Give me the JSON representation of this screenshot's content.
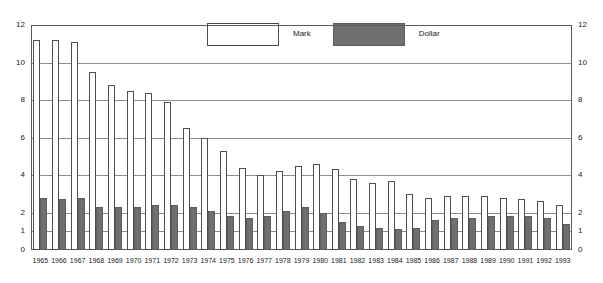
{
  "chart_data": {
    "type": "bar",
    "title": "",
    "subtitle": "",
    "xlabel": "",
    "ylabel": "",
    "ylim": [
      0,
      12
    ],
    "yticks": [
      0,
      1,
      2,
      4,
      6,
      8,
      10,
      12
    ],
    "ytick_labels": [
      "0",
      "1",
      "2",
      "4",
      "6",
      "8",
      "10",
      "12"
    ],
    "grid": true,
    "grid_axis": "y",
    "legend_position": "top-center",
    "dual_y_axis": true,
    "categories": [
      "1965",
      "1966",
      "1967",
      "1968",
      "1969",
      "1970",
      "1971",
      "1972",
      "1973",
      "1974",
      "1975",
      "1976",
      "1977",
      "1978",
      "1979",
      "1980",
      "1981",
      "1982",
      "1983",
      "1984",
      "1985",
      "1986",
      "1987",
      "1988",
      "1989",
      "1990",
      "1991",
      "1992",
      "1993"
    ],
    "series": [
      {
        "name": "Mark",
        "color": "#ffffff",
        "edge_color": "#4d4d4d",
        "values": [
          11.2,
          11.2,
          11.1,
          9.5,
          8.8,
          8.5,
          8.4,
          7.9,
          6.5,
          6.0,
          5.3,
          4.4,
          4.0,
          4.2,
          4.5,
          4.6,
          4.3,
          3.8,
          3.6,
          3.7,
          3.0,
          2.8,
          2.9,
          2.9,
          2.9,
          2.8,
          2.7,
          2.6,
          2.4
        ]
      },
      {
        "name": "Dollar",
        "color": "#706e70",
        "edge_color": "#5e5c5e",
        "values": [
          2.8,
          2.7,
          2.8,
          2.3,
          2.3,
          2.3,
          2.4,
          2.4,
          2.3,
          2.1,
          1.8,
          1.7,
          1.8,
          2.1,
          2.3,
          2.0,
          1.5,
          1.3,
          1.2,
          1.1,
          1.2,
          1.6,
          1.7,
          1.7,
          1.8,
          1.8,
          1.8,
          1.7,
          1.4
        ]
      }
    ]
  },
  "legend": {
    "entries": [
      {
        "label": "Mark",
        "swatch": "mark-swatch-icon"
      },
      {
        "label": "Dollar",
        "swatch": "dollar-swatch-icon"
      }
    ]
  },
  "colors": {
    "mark_fill": "#ffffff",
    "mark_edge": "#4d4d4d",
    "dollar_fill": "#706e70",
    "dollar_edge": "#5e5c5e",
    "gridline": "#8d8d8d",
    "axis": "#5a5a5a",
    "background": "#ffffff",
    "text": "#1a1a1a"
  }
}
